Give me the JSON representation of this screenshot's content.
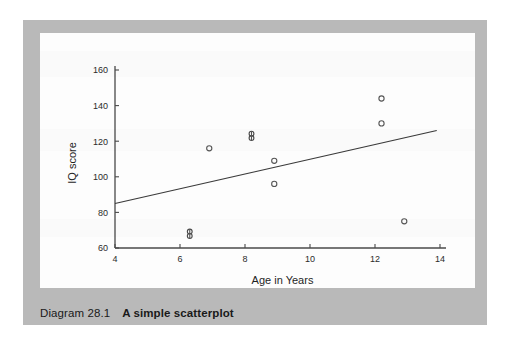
{
  "figure": {
    "caption_label": "Diagram 28.1",
    "caption_title": "A simple scatterplot",
    "frame_color": "#b9b9b9",
    "panel_color": "#fdfdfd"
  },
  "chart_data": {
    "type": "scatter",
    "title": "",
    "xlabel": "Age in Years",
    "ylabel": "IQ score",
    "xlim": [
      4,
      14
    ],
    "ylim": [
      60,
      160
    ],
    "xticks": [
      4,
      6,
      8,
      10,
      12,
      14
    ],
    "yticks": [
      60,
      80,
      100,
      120,
      140,
      160
    ],
    "xtick_labels": [
      "4",
      "6",
      "8",
      "10",
      "12",
      "14"
    ],
    "ytick_labels": [
      "60",
      "80",
      "100",
      "120",
      "140",
      "160"
    ],
    "grid": false,
    "legend": false,
    "marker": "open-circle",
    "marker_color": "#555555",
    "points": [
      {
        "x": 6.3,
        "y": 68,
        "overlap": true
      },
      {
        "x": 6.9,
        "y": 116,
        "overlap": false
      },
      {
        "x": 8.2,
        "y": 123,
        "overlap": true
      },
      {
        "x": 8.9,
        "y": 109,
        "overlap": false
      },
      {
        "x": 8.9,
        "y": 96,
        "overlap": false
      },
      {
        "x": 12.2,
        "y": 144,
        "overlap": false
      },
      {
        "x": 12.2,
        "y": 130,
        "overlap": false
      },
      {
        "x": 12.9,
        "y": 75,
        "overlap": false
      }
    ],
    "trend_line": {
      "name": "regression line",
      "x0": 4,
      "y0": 85,
      "x1": 13.9,
      "y1": 126,
      "color": "#3a3a3a"
    }
  }
}
